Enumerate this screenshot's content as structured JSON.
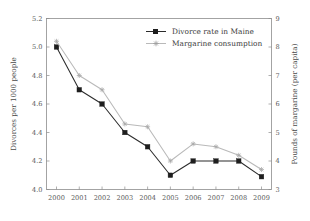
{
  "chart_data": {
    "type": "line",
    "title": "",
    "subtitle": "",
    "xlabel": "",
    "ylabel": "Divorces per 1000 people",
    "y2label": "Pounds of margarine (per capita)",
    "categories": [
      "2000",
      "2001",
      "2002",
      "2003",
      "2004",
      "2005",
      "2006",
      "2007",
      "2008",
      "2009"
    ],
    "x": [
      2000,
      2001,
      2002,
      2003,
      2004,
      2005,
      2006,
      2007,
      2008,
      2009
    ],
    "ylim": [
      4.0,
      5.2
    ],
    "y2lim": [
      3,
      9
    ],
    "yticks": [
      "4.0",
      "4.2",
      "4.4",
      "4.6",
      "4.8",
      "5.0",
      "5.2"
    ],
    "ytick_values": [
      4.0,
      4.2,
      4.4,
      4.6,
      4.8,
      5.0,
      5.2
    ],
    "y2ticks": [
      "3",
      "4",
      "5",
      "6",
      "7",
      "8",
      "9"
    ],
    "y2tick_values": [
      3,
      4,
      5,
      6,
      7,
      8,
      9
    ],
    "grid": false,
    "legend_position": "top-right",
    "series": [
      {
        "name": "Divorce rate in Maine",
        "axis": "left",
        "color": "#1e1e1e",
        "marker": "filled-square",
        "values": [
          5.0,
          4.7,
          4.6,
          4.4,
          4.3,
          4.1,
          4.2,
          4.2,
          4.2,
          4.09
        ]
      },
      {
        "name": "Margarine consumption",
        "axis": "right",
        "color": "#b0b0b0",
        "marker": "star",
        "values": [
          8.2,
          7.0,
          6.5,
          5.3,
          5.2,
          4.0,
          4.6,
          4.5,
          4.2,
          3.7
        ]
      }
    ]
  },
  "legend": {
    "entries": [
      {
        "label": "Divorce rate in Maine"
      },
      {
        "label": "Margarine consumption"
      }
    ]
  },
  "axes": {
    "left_title": "Divorces per 1000 people",
    "right_title": "Pounds of margarine (per capita)"
  }
}
